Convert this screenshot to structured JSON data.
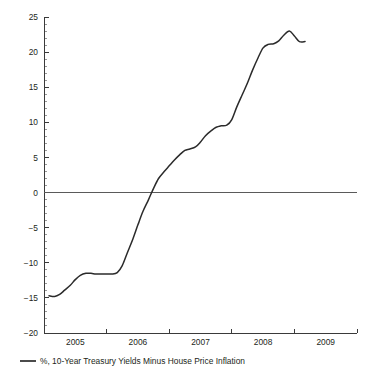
{
  "chart_data": {
    "type": "line",
    "title": "",
    "subtitle": "",
    "xlabel": "",
    "ylabel": "",
    "xlim": [
      2004.5,
      2009.5
    ],
    "ylim": [
      -20,
      25
    ],
    "grid": false,
    "legend_position": "bottom-left",
    "y_ticks": [
      25,
      20,
      15,
      10,
      5,
      0,
      -5,
      -10,
      -15,
      -20
    ],
    "y_tick_labels": [
      "25",
      "20",
      "15",
      "10",
      "5",
      "0",
      "−5",
      "−10",
      "−15",
      "−20"
    ],
    "y_minor_tick_step": 1,
    "x_ticks": [
      2005,
      2006,
      2007,
      2008,
      2009
    ],
    "x_tick_labels": [
      "2005",
      "2006",
      "2007",
      "2008",
      "2009"
    ],
    "x_minor_ticks": [
      2005.5,
      2006.5,
      2007.5,
      2008.5
    ],
    "zero_line": 0,
    "series": [
      {
        "name": "%, 10-Year Treasury Yields Minus House Price Inflation",
        "color": "#2b2b2b",
        "x": [
          2004.58,
          2004.67,
          2004.75,
          2004.83,
          2004.92,
          2005.0,
          2005.08,
          2005.17,
          2005.25,
          2005.33,
          2005.42,
          2005.5,
          2005.58,
          2005.67,
          2005.75,
          2005.83,
          2005.92,
          2006.0,
          2006.08,
          2006.17,
          2006.25,
          2006.33,
          2006.42,
          2006.5,
          2006.58,
          2006.67,
          2006.75,
          2006.83,
          2006.92,
          2007.0,
          2007.08,
          2007.17,
          2007.25,
          2007.33,
          2007.42,
          2007.5,
          2007.58,
          2007.67,
          2007.75,
          2007.83,
          2007.92,
          2008.0,
          2008.08,
          2008.17,
          2008.25,
          2008.33,
          2008.42,
          2008.5,
          2008.58,
          2008.67
        ],
        "y": [
          -14.7,
          -14.8,
          -14.5,
          -13.9,
          -13.2,
          -12.4,
          -11.8,
          -11.5,
          -11.5,
          -11.6,
          -11.6,
          -11.6,
          -11.6,
          -11.4,
          -10.4,
          -8.6,
          -6.6,
          -4.6,
          -2.7,
          -1.0,
          0.6,
          2.0,
          3.0,
          3.8,
          4.6,
          5.4,
          6.0,
          6.2,
          6.5,
          7.2,
          8.1,
          8.8,
          9.3,
          9.5,
          9.6,
          10.4,
          12.2,
          14.0,
          15.6,
          17.4,
          19.2,
          20.6,
          21.1,
          21.2,
          21.6,
          22.4,
          23.0,
          22.3,
          21.5,
          21.5
        ]
      }
    ],
    "legend": [
      {
        "label": "%, 10-Year Treasury Yields Minus House Price Inflation",
        "color": "#2b2b2b"
      }
    ]
  },
  "geometry": {
    "plot_left": 44,
    "plot_right": 357,
    "plot_top": 17,
    "plot_bottom": 333
  }
}
